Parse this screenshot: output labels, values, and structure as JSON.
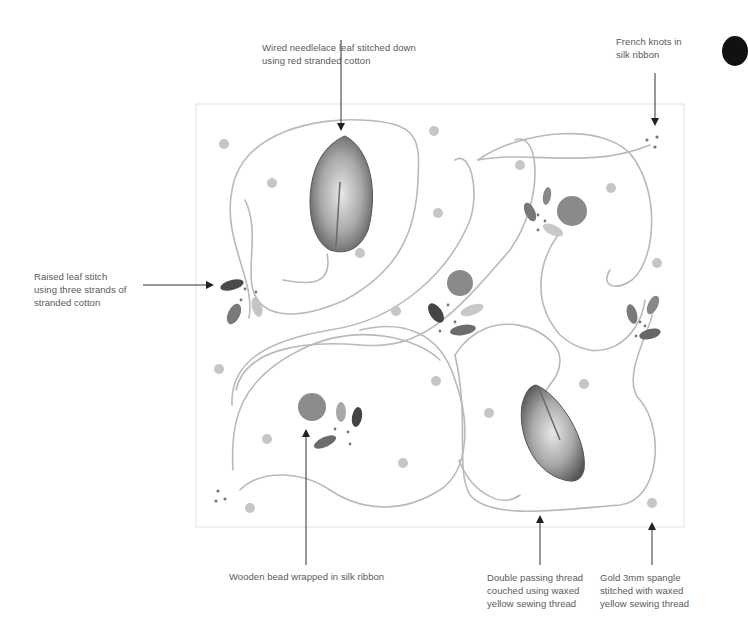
{
  "diagram": {
    "colors": {
      "thread": "#b8b8b8",
      "spangle": "#c4c4c4",
      "leaf_dark": "#4a4a4a",
      "leaf_mid": "#7a7a7a",
      "leaf_light": "#b0b0b0",
      "bead": "#8a8a8a",
      "arrow": "#222222",
      "frame": "#dddddd"
    },
    "callouts": {
      "needlelace_leaf": "Wired needlelace leaf stitched down\nusing red stranded cotton",
      "french_knots": "French knots in\nsilk ribbon",
      "raised_leaf": "Raised leaf stitch\nusing three strands of\nstranded cotton",
      "wooden_bead": "Wooden bead wrapped in silk ribbon",
      "passing_thread": "Double passing thread\ncouched using waxed\nyellow sewing thread",
      "spangle": "Gold 3mm spangle\nstitched with waxed\nyellow sewing thread"
    }
  }
}
